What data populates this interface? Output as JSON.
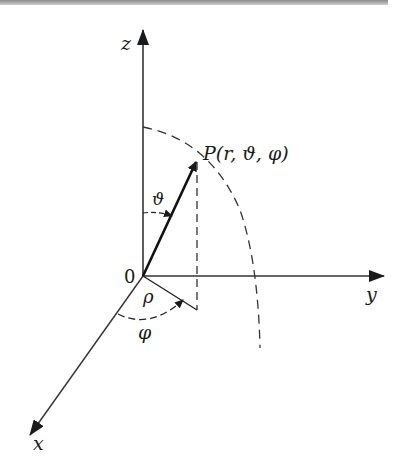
{
  "diagram": {
    "axes": {
      "z_label": "z",
      "y_label": "y",
      "x_label": "x",
      "origin_label": "0"
    },
    "point_label": "P(r, ϑ, φ)",
    "angle_theta_label": "ϑ",
    "angle_phi_label": "φ",
    "rho_label": "ρ",
    "colors": {
      "stroke": "#1a1a1a",
      "background": "#ffffff"
    }
  }
}
